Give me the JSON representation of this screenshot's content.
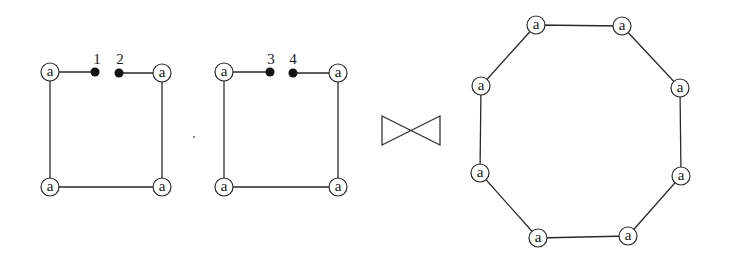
{
  "diagram": {
    "type": "graph-join",
    "node_label": "a",
    "operator": {
      "name": "bowtie-join",
      "symbol": "⋈"
    },
    "left_graph": {
      "nodes": [
        {
          "id": "L1",
          "label": "a"
        },
        {
          "id": "L2",
          "label": "a"
        },
        {
          "id": "L3",
          "label": "a"
        },
        {
          "id": "L4",
          "label": "a"
        }
      ],
      "ports": [
        {
          "id": "p1",
          "label": "1"
        },
        {
          "id": "p2",
          "label": "2"
        }
      ]
    },
    "middle_graph": {
      "nodes": [
        {
          "id": "M1",
          "label": "a"
        },
        {
          "id": "M2",
          "label": "a"
        },
        {
          "id": "M3",
          "label": "a"
        },
        {
          "id": "M4",
          "label": "a"
        }
      ],
      "ports": [
        {
          "id": "p3",
          "label": "3"
        },
        {
          "id": "p4",
          "label": "4"
        }
      ]
    },
    "result_graph": {
      "shape": "octagon",
      "nodes": [
        {
          "id": "R1",
          "label": "a"
        },
        {
          "id": "R2",
          "label": "a"
        },
        {
          "id": "R3",
          "label": "a"
        },
        {
          "id": "R4",
          "label": "a"
        },
        {
          "id": "R5",
          "label": "a"
        },
        {
          "id": "R6",
          "label": "a"
        },
        {
          "id": "R7",
          "label": "a"
        },
        {
          "id": "R8",
          "label": "a"
        }
      ]
    }
  }
}
